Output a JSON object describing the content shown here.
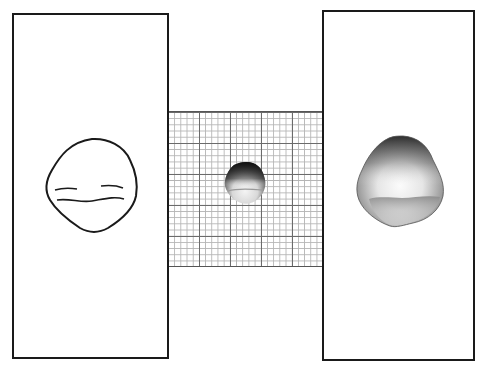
{
  "figure": {
    "panels": [
      {
        "id": "left",
        "content": "line-drawing",
        "subject": "outline of specimen with two horizontal contour lines"
      },
      {
        "id": "center",
        "content": "graph-paper",
        "subject": "small shaded specimen on grid"
      },
      {
        "id": "right",
        "content": "shaded-rendering",
        "subject": "enlarged shaded specimen"
      }
    ],
    "colors": {
      "border": "#1a1a1a",
      "grid_major": "#6b6b6b",
      "grid_minor": "#b5b5b5",
      "background": "#ffffff"
    },
    "grid": {
      "major_spacing_px": 31,
      "minor_divisions": 5
    }
  }
}
